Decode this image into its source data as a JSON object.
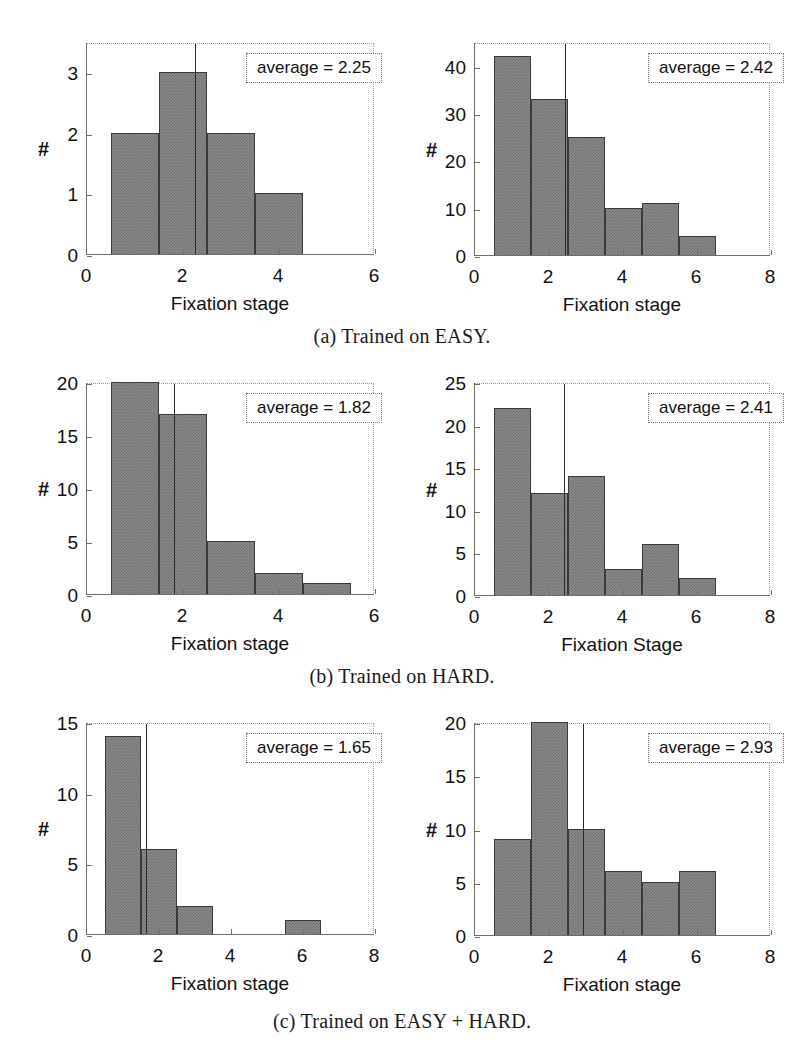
{
  "figure": {
    "panels": [
      {
        "id": "a",
        "caption": "(a) Trained on EASY.",
        "charts": [
          {
            "name": "easy-trained-easy-test",
            "chart_data": {
              "type": "bar",
              "title": "",
              "xlabel": "Fixation stage",
              "ylabel": "#",
              "categories": [
                1,
                2,
                3,
                4
              ],
              "bin_edges": [
                0.5,
                1.5,
                2.5,
                3.5,
                4.5
              ],
              "values": [
                2,
                3,
                2,
                1
              ],
              "xlim": [
                0,
                6
              ],
              "ylim": [
                0,
                3.5
              ],
              "xticks": [
                0,
                2,
                4,
                6
              ],
              "yticks": [
                0,
                1,
                2,
                3
              ],
              "xticklabels": [
                "0",
                "2",
                "4",
                "6"
              ],
              "yticklabels": [
                "0",
                "1",
                "2",
                "3"
              ],
              "grid": false,
              "annotations": [
                {
                  "text": "average = 2.25",
                  "value": 2.25
                }
              ],
              "mean_line": 2.25
            }
          },
          {
            "name": "easy-trained-hard-test",
            "chart_data": {
              "type": "bar",
              "title": "",
              "xlabel": "Fixation stage",
              "ylabel": "#",
              "categories": [
                1,
                2,
                3,
                4,
                5,
                6
              ],
              "bin_edges": [
                0.5,
                1.5,
                2.5,
                3.5,
                4.5,
                5.5,
                6.5
              ],
              "values": [
                42,
                33,
                25,
                10,
                11,
                4
              ],
              "xlim": [
                0,
                8
              ],
              "ylim": [
                0,
                45
              ],
              "xticks": [
                0,
                2,
                4,
                6,
                8
              ],
              "yticks": [
                0,
                10,
                20,
                30,
                40
              ],
              "xticklabels": [
                "0",
                "2",
                "4",
                "6",
                "8"
              ],
              "yticklabels": [
                "0",
                "10",
                "20",
                "30",
                "40"
              ],
              "grid": false,
              "annotations": [
                {
                  "text": "average = 2.42",
                  "value": 2.42
                }
              ],
              "mean_line": 2.42
            }
          }
        ]
      },
      {
        "id": "b",
        "caption": "(b) Trained on HARD.",
        "charts": [
          {
            "name": "hard-trained-easy-test",
            "chart_data": {
              "type": "bar",
              "title": "",
              "xlabel": "Fixation stage",
              "ylabel": "#",
              "categories": [
                1,
                2,
                3,
                4,
                5
              ],
              "bin_edges": [
                0.5,
                1.5,
                2.5,
                3.5,
                4.5,
                5.5
              ],
              "values": [
                20,
                17,
                5,
                2,
                1
              ],
              "xlim": [
                0,
                6
              ],
              "ylim": [
                0,
                20
              ],
              "xticks": [
                0,
                2,
                4,
                6
              ],
              "yticks": [
                0,
                5,
                10,
                15,
                20
              ],
              "xticklabels": [
                "0",
                "2",
                "4",
                "6"
              ],
              "yticklabels": [
                "0",
                "5",
                "10",
                "15",
                "20"
              ],
              "grid": false,
              "annotations": [
                {
                  "text": "average = 1.82",
                  "value": 1.82
                }
              ],
              "mean_line": 1.82
            }
          },
          {
            "name": "hard-trained-hard-test",
            "chart_data": {
              "type": "bar",
              "title": "",
              "xlabel": "Fixation Stage",
              "ylabel": "#",
              "categories": [
                1,
                2,
                3,
                4,
                5,
                6
              ],
              "bin_edges": [
                0.5,
                1.5,
                2.5,
                3.5,
                4.5,
                5.5,
                6.5
              ],
              "values": [
                22,
                12,
                14,
                3,
                6,
                2
              ],
              "xlim": [
                0,
                8
              ],
              "ylim": [
                0,
                25
              ],
              "xticks": [
                0,
                2,
                4,
                6,
                8
              ],
              "yticks": [
                0,
                5,
                10,
                15,
                20,
                25
              ],
              "xticklabels": [
                "0",
                "2",
                "4",
                "6",
                "8"
              ],
              "yticklabels": [
                "0",
                "5",
                "10",
                "15",
                "20",
                "25"
              ],
              "grid": false,
              "annotations": [
                {
                  "text": "average = 2.41",
                  "value": 2.41
                }
              ],
              "mean_line": 2.41
            }
          }
        ]
      },
      {
        "id": "c",
        "caption": "(c) Trained on EASY + HARD.",
        "charts": [
          {
            "name": "easyhard-trained-easy-test",
            "chart_data": {
              "type": "bar",
              "title": "",
              "xlabel": "Fixation stage",
              "ylabel": "#",
              "categories": [
                1,
                2,
                3,
                4,
                5,
                6
              ],
              "bin_edges": [
                0.5,
                1.5,
                2.5,
                3.5,
                4.5,
                5.5,
                6.5
              ],
              "values": [
                14,
                6,
                2,
                0,
                0,
                1
              ],
              "xlim": [
                0,
                8
              ],
              "ylim": [
                0,
                15
              ],
              "xticks": [
                0,
                2,
                4,
                6,
                8
              ],
              "yticks": [
                0,
                5,
                10,
                15
              ],
              "xticklabels": [
                "0",
                "2",
                "4",
                "6",
                "8"
              ],
              "yticklabels": [
                "0",
                "5",
                "10",
                "15"
              ],
              "grid": false,
              "annotations": [
                {
                  "text": "average = 1.65",
                  "value": 1.65
                }
              ],
              "mean_line": 1.65
            }
          },
          {
            "name": "easyhard-trained-hard-test",
            "chart_data": {
              "type": "bar",
              "title": "",
              "xlabel": "Fixation stage",
              "ylabel": "#",
              "categories": [
                1,
                2,
                3,
                4,
                5,
                6
              ],
              "bin_edges": [
                0.5,
                1.5,
                2.5,
                3.5,
                4.5,
                5.5,
                6.5
              ],
              "values": [
                9,
                20,
                10,
                6,
                5,
                6
              ],
              "xlim": [
                0,
                8
              ],
              "ylim": [
                0,
                20
              ],
              "xticks": [
                0,
                2,
                4,
                6,
                8
              ],
              "yticks": [
                0,
                5,
                10,
                15,
                20
              ],
              "xticklabels": [
                "0",
                "2",
                "4",
                "6",
                "8"
              ],
              "yticklabels": [
                "0",
                "5",
                "10",
                "15",
                "20"
              ],
              "grid": false,
              "annotations": [
                {
                  "text": "average = 2.93",
                  "value": 2.93
                }
              ],
              "mean_line": 2.93
            }
          }
        ]
      }
    ],
    "colors": {
      "bar_fill": "#8a8a8a",
      "bar_edge": "#3a3a3a",
      "axis": "#6e6e6e",
      "text": "#111111",
      "background": "#ffffff"
    }
  }
}
